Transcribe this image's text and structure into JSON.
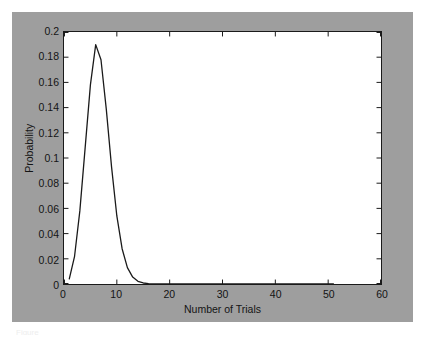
{
  "figure": {
    "background_color": "#9e9e9e",
    "plot_background_color": "#ffffff",
    "axis_color": "#1a1a1a",
    "line_color": "#1a1a1a",
    "caption_fragment": "Figure"
  },
  "chart_data": {
    "type": "line",
    "title": "",
    "xlabel": "Number of Trials",
    "ylabel": "Probability",
    "xlim": [
      0,
      60
    ],
    "ylim": [
      0,
      0.2
    ],
    "xticks": [
      0,
      10,
      20,
      30,
      40,
      50,
      60
    ],
    "xtick_labels": [
      "0",
      "10",
      "20",
      "30",
      "40",
      "50",
      "60"
    ],
    "yticks": [
      0,
      0.02,
      0.04,
      0.06,
      0.08,
      0.1,
      0.12,
      0.14,
      0.16,
      0.18,
      0.2
    ],
    "ytick_labels": [
      "0",
      "0.02",
      "0.04",
      "0.06",
      "0.08",
      "0.1",
      "0.12",
      "0.14",
      "0.16",
      "0.18",
      "0.2"
    ],
    "grid": false,
    "legend": null,
    "series": [
      {
        "name": "Probability",
        "x": [
          1,
          2,
          3,
          4,
          5,
          6,
          7,
          8,
          9,
          10,
          11,
          12,
          13,
          14,
          15,
          16,
          17,
          18,
          19,
          20,
          21,
          22,
          23,
          24,
          25,
          26,
          27,
          28,
          29,
          30,
          31,
          32,
          33,
          34,
          35,
          36,
          37,
          38,
          39,
          40,
          41,
          42,
          43,
          44,
          45,
          46,
          47,
          48,
          49,
          50,
          51
        ],
        "y": [
          0.004,
          0.022,
          0.058,
          0.108,
          0.158,
          0.19,
          0.178,
          0.139,
          0.093,
          0.054,
          0.028,
          0.013,
          0.0055,
          0.0021,
          0.0008,
          0.0003,
          0.0001,
          4e-05,
          1e-05,
          5e-06,
          2e-06,
          1e-06,
          5e-07,
          2e-07,
          1e-07,
          0,
          0,
          0,
          0,
          0,
          0,
          0,
          0,
          0,
          0,
          0,
          0,
          0,
          0,
          0,
          0,
          0,
          0,
          0,
          0,
          0,
          0,
          0,
          0,
          0,
          0
        ]
      }
    ],
    "peak": {
      "x": 6,
      "y": 0.19
    }
  }
}
